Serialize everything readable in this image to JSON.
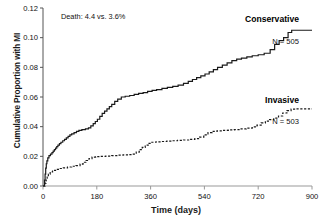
{
  "chart_data": {
    "type": "line",
    "title": "",
    "xlabel": "Time (days)",
    "ylabel": "Cumulative Proportion with MI",
    "xlim": [
      0,
      900
    ],
    "ylim": [
      0,
      0.12
    ],
    "grid": false,
    "legend_position": "right-inline",
    "xticks": [
      "0",
      "180",
      "360",
      "540",
      "720",
      "900"
    ],
    "xtick_values": [
      0,
      180,
      360,
      540,
      720,
      900
    ],
    "yticks": [
      "0.00",
      "0.02",
      "0.04",
      "0.06",
      "0.08",
      "0.10",
      "0.12"
    ],
    "ytick_values": [
      0.0,
      0.02,
      0.04,
      0.06,
      0.08,
      0.1,
      0.12
    ],
    "annotations": [
      {
        "name": "death-annotation",
        "text": "Death: 4.4 vs. 3.6%",
        "x": 60,
        "y": 0.1155
      }
    ],
    "series": [
      {
        "name": "Conservative",
        "label": "Conservative",
        "n_label": "N = 505",
        "n": 505,
        "style": "solid",
        "color": "#1a1a1a",
        "final_value": 0.105,
        "points": [
          [
            0,
            0.0
          ],
          [
            4,
            0.0
          ],
          [
            5,
            0.004
          ],
          [
            7,
            0.008
          ],
          [
            9,
            0.012
          ],
          [
            11,
            0.015
          ],
          [
            13,
            0.017
          ],
          [
            16,
            0.019
          ],
          [
            20,
            0.0205
          ],
          [
            25,
            0.0215
          ],
          [
            30,
            0.0225
          ],
          [
            34,
            0.0235
          ],
          [
            38,
            0.0245
          ],
          [
            42,
            0.0255
          ],
          [
            46,
            0.0265
          ],
          [
            50,
            0.0275
          ],
          [
            55,
            0.0285
          ],
          [
            60,
            0.0295
          ],
          [
            66,
            0.0305
          ],
          [
            72,
            0.0315
          ],
          [
            78,
            0.0325
          ],
          [
            84,
            0.0335
          ],
          [
            90,
            0.0345
          ],
          [
            96,
            0.0352
          ],
          [
            104,
            0.036
          ],
          [
            112,
            0.0368
          ],
          [
            120,
            0.0375
          ],
          [
            130,
            0.038
          ],
          [
            142,
            0.0385
          ],
          [
            152,
            0.0392
          ],
          [
            160,
            0.0405
          ],
          [
            168,
            0.042
          ],
          [
            175,
            0.0435
          ],
          [
            182,
            0.045
          ],
          [
            190,
            0.047
          ],
          [
            198,
            0.049
          ],
          [
            206,
            0.0505
          ],
          [
            214,
            0.052
          ],
          [
            222,
            0.0535
          ],
          [
            230,
            0.055
          ],
          [
            240,
            0.057
          ],
          [
            250,
            0.0585
          ],
          [
            262,
            0.06
          ],
          [
            275,
            0.0605
          ],
          [
            290,
            0.061
          ],
          [
            305,
            0.0618
          ],
          [
            320,
            0.0625
          ],
          [
            335,
            0.063
          ],
          [
            350,
            0.0638
          ],
          [
            365,
            0.0645
          ],
          [
            380,
            0.065
          ],
          [
            398,
            0.0658
          ],
          [
            416,
            0.0665
          ],
          [
            434,
            0.0672
          ],
          [
            452,
            0.068
          ],
          [
            470,
            0.0692
          ],
          [
            486,
            0.0705
          ],
          [
            500,
            0.0718
          ],
          [
            514,
            0.073
          ],
          [
            528,
            0.0742
          ],
          [
            542,
            0.0755
          ],
          [
            556,
            0.077
          ],
          [
            570,
            0.0785
          ],
          [
            584,
            0.08
          ],
          [
            600,
            0.0815
          ],
          [
            616,
            0.083
          ],
          [
            632,
            0.0845
          ],
          [
            648,
            0.0855
          ],
          [
            664,
            0.0862
          ],
          [
            682,
            0.087
          ],
          [
            700,
            0.0878
          ],
          [
            720,
            0.0885
          ],
          [
            740,
            0.0895
          ],
          [
            760,
            0.092
          ],
          [
            775,
            0.0955
          ],
          [
            790,
            0.098
          ],
          [
            805,
            0.1
          ],
          [
            820,
            0.1035
          ],
          [
            832,
            0.105
          ],
          [
            900,
            0.105
          ]
        ]
      },
      {
        "name": "Invasive",
        "label": "Invasive",
        "n_label": "N = 503",
        "n": 503,
        "style": "dashed",
        "color": "#1a1a1a",
        "final_value": 0.052,
        "points": [
          [
            0,
            0.0
          ],
          [
            5,
            0.0
          ],
          [
            7,
            0.002
          ],
          [
            10,
            0.004
          ],
          [
            14,
            0.006
          ],
          [
            18,
            0.008
          ],
          [
            24,
            0.0095
          ],
          [
            32,
            0.0105
          ],
          [
            42,
            0.0112
          ],
          [
            54,
            0.0118
          ],
          [
            68,
            0.0122
          ],
          [
            82,
            0.0128
          ],
          [
            96,
            0.0133
          ],
          [
            110,
            0.0138
          ],
          [
            124,
            0.0148
          ],
          [
            134,
            0.016
          ],
          [
            144,
            0.0172
          ],
          [
            154,
            0.0185
          ],
          [
            164,
            0.0195
          ],
          [
            176,
            0.0198
          ],
          [
            192,
            0.02
          ],
          [
            210,
            0.0202
          ],
          [
            230,
            0.0205
          ],
          [
            250,
            0.0208
          ],
          [
            268,
            0.021
          ],
          [
            285,
            0.0212
          ],
          [
            300,
            0.0215
          ],
          [
            312,
            0.0228
          ],
          [
            322,
            0.0245
          ],
          [
            332,
            0.026
          ],
          [
            342,
            0.0275
          ],
          [
            352,
            0.0288
          ],
          [
            362,
            0.0295
          ],
          [
            378,
            0.0298
          ],
          [
            396,
            0.03
          ],
          [
            414,
            0.0302
          ],
          [
            432,
            0.0305
          ],
          [
            450,
            0.0308
          ],
          [
            470,
            0.031
          ],
          [
            490,
            0.0315
          ],
          [
            508,
            0.032
          ],
          [
            524,
            0.033
          ],
          [
            538,
            0.0345
          ],
          [
            552,
            0.036
          ],
          [
            566,
            0.0368
          ],
          [
            582,
            0.0372
          ],
          [
            600,
            0.0375
          ],
          [
            620,
            0.0378
          ],
          [
            640,
            0.038
          ],
          [
            660,
            0.0385
          ],
          [
            680,
            0.039
          ],
          [
            700,
            0.0398
          ],
          [
            716,
            0.041
          ],
          [
            730,
            0.0425
          ],
          [
            744,
            0.0438
          ],
          [
            758,
            0.0448
          ],
          [
            772,
            0.0458
          ],
          [
            788,
            0.0472
          ],
          [
            802,
            0.0492
          ],
          [
            816,
            0.0508
          ],
          [
            830,
            0.0518
          ],
          [
            845,
            0.052
          ],
          [
            900,
            0.052
          ]
        ]
      }
    ]
  },
  "axis": {
    "y_title": "Cumulative Proportion with MI",
    "x_title": "Time (days)"
  }
}
